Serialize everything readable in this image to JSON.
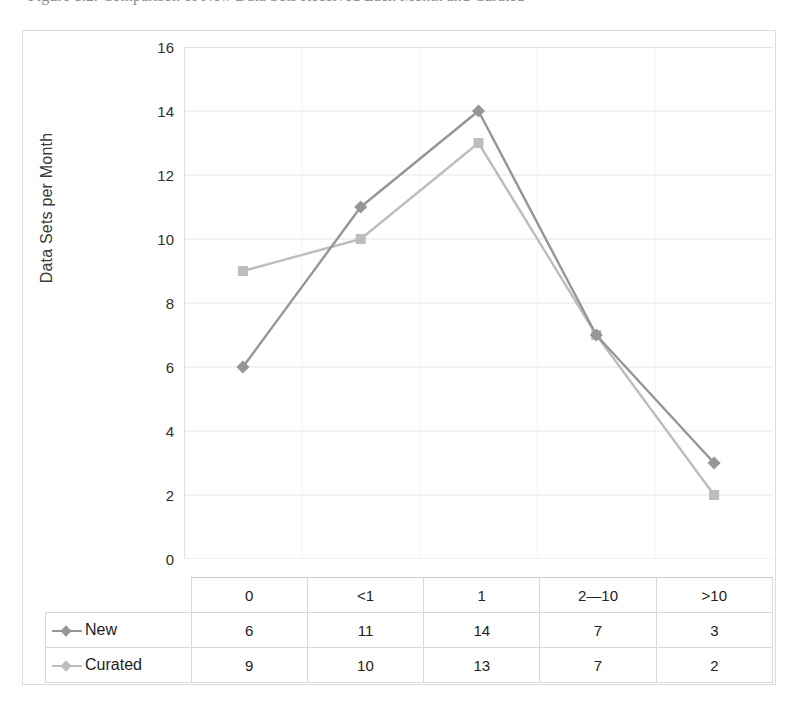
{
  "caption": {
    "text": "Figure 1.2. Comparison of New Data Sets Received Each Month and Curated"
  },
  "chart_data": {
    "type": "line",
    "title": "",
    "xlabel": "",
    "ylabel": "Data Sets per Month",
    "categories": [
      "0",
      "<1",
      "1",
      "2—10",
      ">10"
    ],
    "ylim": [
      0,
      16
    ],
    "ytick_step": 2,
    "yticks": [
      "16",
      "14",
      "12",
      "10",
      "8",
      "6",
      "4",
      "2",
      "0"
    ],
    "grid": true,
    "legend_position": "data-table-row-headers",
    "series": [
      {
        "name": "New",
        "values": [
          6,
          11,
          14,
          7,
          3
        ],
        "color": "#969696",
        "marker": "diamond"
      },
      {
        "name": "Curated",
        "values": [
          9,
          10,
          13,
          7,
          2
        ],
        "color": "#bdbdbd",
        "marker": "square"
      }
    ]
  },
  "data_table": {
    "corner": "",
    "column_headers": [
      "0",
      "<1",
      "1",
      "2—10",
      ">10"
    ],
    "rows": [
      {
        "label": "New",
        "values": [
          "6",
          "11",
          "14",
          "7",
          "3"
        ]
      },
      {
        "label": "Curated",
        "values": [
          "9",
          "10",
          "13",
          "7",
          "2"
        ]
      }
    ]
  },
  "colors": {
    "series_new": "#969696",
    "series_curated": "#bdbdbd",
    "gridline": "#e3e3e3",
    "frame": "#dcdcdc",
    "table_border": "#d8d8d8",
    "text": "#222222"
  }
}
